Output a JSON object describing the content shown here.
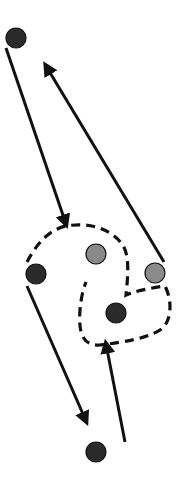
{
  "diagram": {
    "type": "node-movement-diagram",
    "colors": {
      "background": "#ffffff",
      "dark_node": "#2b2b2b",
      "gray_node": "#8a8a8a",
      "stroke": "#111111"
    },
    "nodes": [
      {
        "id": "n1",
        "kind": "dark",
        "x": 16,
        "y": 38
      },
      {
        "id": "n2",
        "kind": "dark",
        "x": 36,
        "y": 274
      },
      {
        "id": "n3",
        "kind": "gray",
        "x": 96,
        "y": 254
      },
      {
        "id": "n4",
        "kind": "gray",
        "x": 155,
        "y": 273
      },
      {
        "id": "n5",
        "kind": "dark",
        "x": 116,
        "y": 313
      },
      {
        "id": "n6",
        "kind": "dark",
        "x": 96,
        "y": 452
      }
    ],
    "arrows": [
      {
        "id": "a1",
        "from": [
          6,
          48
        ],
        "to": [
          66,
          224
        ],
        "direction": "down"
      },
      {
        "id": "a2",
        "from": [
          164,
          262
        ],
        "to": [
          46,
          66
        ],
        "direction": "up"
      },
      {
        "id": "a3",
        "from": [
          27,
          286
        ],
        "to": [
          86,
          421
        ],
        "direction": "down"
      },
      {
        "id": "a4",
        "from": [
          125,
          442
        ],
        "to": [
          106,
          344
        ],
        "direction": "up"
      }
    ],
    "dashed_region": {
      "path": "M27,262 C36,245 48,230 66,226 C88,222 110,228 122,244 C130,255 128,275 126,295 C132,292 150,288 165,286 C172,300 172,318 163,328 C150,338 125,342 100,345 C84,346 78,335 80,310 C81,298 83,290 86,282"
    }
  }
}
